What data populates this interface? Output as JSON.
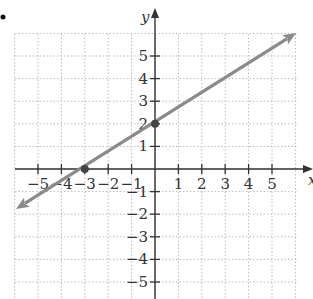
{
  "chart_data": {
    "type": "line",
    "title": "",
    "xlabel": "x",
    "ylabel": "y",
    "xlim": [
      -6,
      6
    ],
    "ylim": [
      -6,
      6
    ],
    "grid": true,
    "grid_style": "dotted",
    "x_ticks": [
      -5,
      -4,
      -3,
      -2,
      -1,
      1,
      2,
      3,
      4,
      5
    ],
    "y_ticks": [
      5,
      4,
      3,
      2,
      1,
      -1,
      -2,
      -3,
      -4,
      -5
    ],
    "x_tick_labels": [
      "−5",
      "−4",
      "−3",
      "−2",
      "−1",
      "1",
      "2",
      "3",
      "4",
      "5"
    ],
    "y_tick_labels": [
      "5",
      "4",
      "3",
      "2",
      "1",
      "−1",
      "−2",
      "−3",
      "−4",
      "−5"
    ],
    "series": [
      {
        "name": "line",
        "equation": "y = (2/3)x + 2",
        "slope": 0.6667,
        "intercept": 2,
        "x": [
          -6,
          6
        ],
        "y": [
          -2,
          6
        ],
        "arrows": "both",
        "color": "#8a8a8a"
      }
    ],
    "points": [
      {
        "label": "x-intercept",
        "x": -3,
        "y": 0
      },
      {
        "label": "y-intercept",
        "x": 0,
        "y": 2
      }
    ],
    "legend": null
  },
  "colors": {
    "axis": "#333333",
    "grid": "#bbbbbb",
    "line": "#8a8a8a",
    "point": "#444444"
  }
}
